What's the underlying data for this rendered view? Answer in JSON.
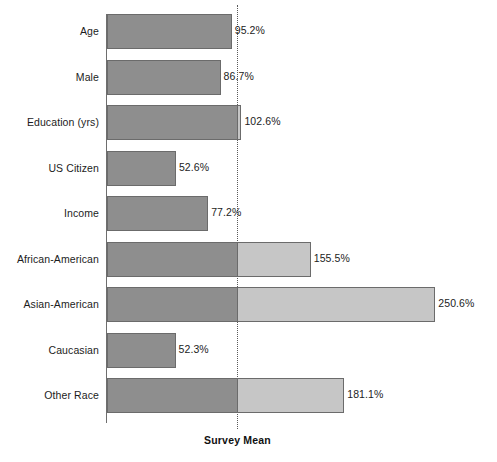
{
  "chart_data": {
    "type": "bar",
    "orientation": "horizontal",
    "title": "",
    "xlabel": "",
    "ylabel": "",
    "reference_line": {
      "label": "Survey Mean",
      "value": 100,
      "style": "dotted"
    },
    "value_suffix": "%",
    "xlim": [
      0,
      260
    ],
    "grid": false,
    "legend": null,
    "colors": {
      "below_mean": "#8e8e8e",
      "above_mean": "#c6c6c6",
      "bar_border": "#6b6b6b",
      "axis": "#6e6e6e",
      "reference_line": "#5a5a5a",
      "text": "#1c1c1c"
    },
    "categories": [
      "Age",
      "Male",
      "Education (yrs)",
      "US Citizen",
      "Income",
      "African-American",
      "Asian-American",
      "Caucasian",
      "Other Race"
    ],
    "values": [
      95.2,
      86.7,
      102.6,
      52.6,
      77.2,
      155.5,
      250.6,
      52.3,
      181.1
    ],
    "value_labels": [
      "95.2%",
      "86.7%",
      "102.6%",
      "52.6%",
      "77.2%",
      "155.5%",
      "250.6%",
      "52.3%",
      "181.1%"
    ],
    "points": [
      {
        "category": "Age",
        "value": 95.2,
        "label": "95.2%"
      },
      {
        "category": "Male",
        "value": 86.7,
        "label": "86.7%"
      },
      {
        "category": "Education (yrs)",
        "value": 102.6,
        "label": "102.6%"
      },
      {
        "category": "US Citizen",
        "value": 52.6,
        "label": "52.6%"
      },
      {
        "category": "Income",
        "value": 77.2,
        "label": "77.2%"
      },
      {
        "category": "African-American",
        "value": 155.5,
        "label": "155.5%"
      },
      {
        "category": "Asian-American",
        "value": 250.6,
        "label": "250.6%"
      },
      {
        "category": "Caucasian",
        "value": 52.3,
        "label": "52.3%"
      },
      {
        "category": "Other Race",
        "value": 181.1,
        "label": "181.1%"
      }
    ]
  }
}
